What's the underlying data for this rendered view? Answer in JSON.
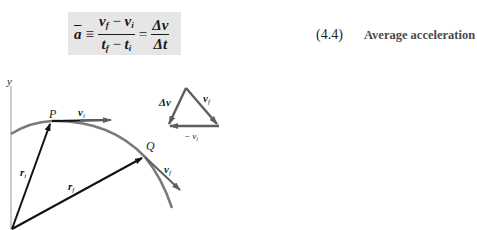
{
  "equation": {
    "lhs": "a",
    "equiv": "≡",
    "frac1": {
      "num_a": "v",
      "num_a_sub": "f",
      "minus": " − ",
      "num_b": "v",
      "num_b_sub": "i",
      "den_a": "t",
      "den_a_sub": "f",
      "den_b": "t",
      "den_b_sub": "i"
    },
    "equals": "=",
    "frac2": {
      "num": "Δv",
      "den": "Δt"
    },
    "number": "(4.4)",
    "caption": "Average acceleration"
  },
  "diagram": {
    "axis_label": "y",
    "point_p": "P",
    "point_q": "Q",
    "r_i": {
      "base": "r",
      "sub": "i"
    },
    "r_f": {
      "base": "r",
      "sub": "f"
    },
    "v_i": {
      "base": "v",
      "sub": "i"
    },
    "v_f": {
      "base": "v",
      "sub": "f"
    },
    "triangle": {
      "delta_v": "Δv",
      "v_f": {
        "base": "v",
        "sub": "f"
      },
      "neg_v_i": {
        "base": "− v",
        "sub": "i"
      }
    },
    "colors": {
      "curve": "#7a7a7a",
      "vector": "#111111",
      "velocity": "#5e5e5e",
      "axis": "#9a9a9a"
    }
  }
}
